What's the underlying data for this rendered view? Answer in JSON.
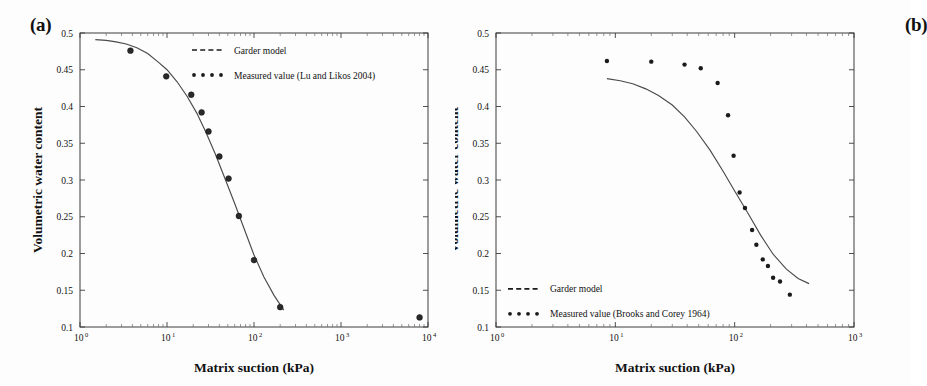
{
  "figure": {
    "background": "#fdfdfd",
    "panels": [
      {
        "id": "a",
        "label": "(a)",
        "xlabel": "Matrix suction (kPa)",
        "ylabel": "Volumetric water content",
        "legend": [
          {
            "key": "garder-model",
            "style": "dashed",
            "label": "Garder model"
          },
          {
            "key": "measured-value",
            "style": "dotted",
            "label": "Measured value (Lu and Likos 2004)"
          }
        ]
      },
      {
        "id": "b",
        "label": "(b)",
        "xlabel": "Matrix suction (kPa)",
        "ylabel": "Volumetric water content",
        "legend": [
          {
            "key": "garder-model",
            "style": "dashed",
            "label": "Garder model"
          },
          {
            "key": "measured-value",
            "style": "dotted",
            "label": "Measured value (Brooks and Corey 1964)"
          }
        ]
      }
    ]
  },
  "chart_data": [
    {
      "type": "scatter",
      "panel": "a",
      "title": "(a)",
      "xlabel": "Matrix suction (kPa)",
      "ylabel": "Volumetric water content",
      "xscale": "log",
      "xlim": [
        1,
        10000
      ],
      "ylim": [
        0.1,
        0.5
      ],
      "xticks": [
        1,
        10,
        100,
        1000,
        10000
      ],
      "xticklabels": [
        "10^0",
        "10^1",
        "10^2",
        "10^3",
        "10^4"
      ],
      "yticks": [
        0.1,
        0.15,
        0.2,
        0.25,
        0.3,
        0.35,
        0.4,
        0.45,
        0.5
      ],
      "yticklabels": [
        "0.1",
        "0.15",
        "0.2",
        "0.25",
        "0.3",
        "0.35",
        "0.4",
        "0.45",
        "0.5"
      ],
      "grid": false,
      "legend_position": "upper right",
      "series": [
        {
          "name": "Garder model",
          "style": "dashed-line",
          "x": [
            1.5,
            2,
            2.6,
            3.4,
            4.5,
            6,
            8,
            10,
            13,
            17,
            22,
            28,
            36,
            46,
            60,
            78,
            100,
            130,
            170,
            220
          ],
          "y": [
            0.491,
            0.49,
            0.488,
            0.485,
            0.48,
            0.472,
            0.46,
            0.45,
            0.434,
            0.414,
            0.391,
            0.365,
            0.335,
            0.303,
            0.268,
            0.232,
            0.198,
            0.168,
            0.143,
            0.123
          ]
        },
        {
          "name": "Measured value (Lu and Likos 2004)",
          "style": "dots",
          "x": [
            3.8,
            9.8,
            19,
            25,
            30,
            40,
            51,
            67,
            100,
            200,
            8000
          ],
          "y": [
            0.476,
            0.441,
            0.416,
            0.392,
            0.366,
            0.332,
            0.302,
            0.251,
            0.191,
            0.127,
            0.113
          ]
        }
      ]
    },
    {
      "type": "scatter",
      "panel": "b",
      "title": "(b)",
      "xlabel": "Matrix suction (kPa)",
      "ylabel": "Volumetric water content",
      "xscale": "log",
      "xlim": [
        1,
        1000
      ],
      "ylim": [
        0.1,
        0.5
      ],
      "xticks": [
        1,
        10,
        100,
        1000
      ],
      "xticklabels": [
        "10^0",
        "10^1",
        "10^2",
        "10^3"
      ],
      "yticks": [
        0.1,
        0.15,
        0.2,
        0.25,
        0.3,
        0.35,
        0.4,
        0.45,
        0.5
      ],
      "yticklabels": [
        "0.1",
        "0.15",
        "0.2",
        "0.25",
        "0.3",
        "0.35",
        "0.4",
        "0.45",
        "0.5"
      ],
      "grid": false,
      "legend_position": "lower left",
      "series": [
        {
          "name": "Garder model",
          "style": "dashed-line",
          "x": [
            8.5,
            11,
            14,
            18,
            23,
            30,
            38,
            48,
            62,
            80,
            100,
            130,
            165,
            210,
            270,
            340,
            420
          ],
          "y": [
            0.438,
            0.435,
            0.431,
            0.424,
            0.415,
            0.402,
            0.386,
            0.366,
            0.341,
            0.312,
            0.285,
            0.254,
            0.225,
            0.199,
            0.179,
            0.166,
            0.159
          ]
        },
        {
          "name": "Measured value (Brooks and Corey 1964)",
          "style": "dots",
          "x": [
            8.5,
            20,
            38,
            52,
            72,
            88,
            98,
            110,
            122,
            140,
            152,
            172,
            190,
            210,
            240,
            290
          ],
          "y": [
            0.462,
            0.461,
            0.457,
            0.452,
            0.432,
            0.388,
            0.333,
            0.283,
            0.262,
            0.232,
            0.212,
            0.192,
            0.183,
            0.167,
            0.162,
            0.144
          ]
        }
      ]
    }
  ]
}
